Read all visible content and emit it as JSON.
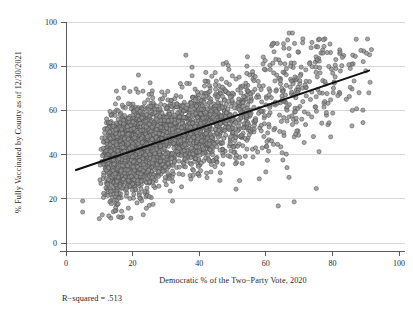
{
  "figure": {
    "background_color": "#ffffff",
    "width": 413,
    "height": 316
  },
  "chart_data": {
    "type": "scatter",
    "title": "",
    "xlabel": "Democratic % of the Two−Party Vote, 2020",
    "ylabel": "% Fully Vaccinated by County as of 12/30/2021",
    "xlim": [
      0,
      100
    ],
    "ylim": [
      0,
      100
    ],
    "xticks": [
      0,
      20,
      40,
      60,
      80,
      100
    ],
    "yticks": [
      0,
      20,
      40,
      60,
      80,
      100
    ],
    "xtick_labels": [
      "0",
      "20",
      "40",
      "60",
      "80",
      "100"
    ],
    "ytick_labels": [
      "0",
      "20",
      "40",
      "60",
      "80",
      "100"
    ],
    "grid": "horizontal",
    "legend": "none",
    "marker": {
      "shape": "circle",
      "fill_color": "#8f8f8f",
      "edge_color": "#4f4f4f",
      "radius_px": 2.1,
      "opacity": 0.78
    },
    "point_count": 3110,
    "x_range_observed": [
      3,
      92
    ],
    "y_range_observed": [
      11,
      95
    ],
    "annotations": [
      {
        "name": "r-squared-note",
        "text": "R−squared = .513",
        "x_px": 62,
        "y_px": 298
      }
    ],
    "fit_line": {
      "name": "linear-regression-line",
      "color": "#111111",
      "width_px": 2.1,
      "x_start": 3,
      "y_start": 33,
      "x_end": 91,
      "y_end": 78,
      "slope": 0.511,
      "intercept": 31.47,
      "r_squared": 0.513
    },
    "series": [
      {
        "name": "counties",
        "description": "US counties: Democratic two-party vote share 2020 vs % fully vaccinated as of 12/30/2021",
        "correlation": 0.716
      }
    ],
    "density_profile": {
      "note": "Dense overlapping cloud concentrated between 10-60% Democratic vote and 30-65% vaccinated, with a thinning right tail and scattered high/low outliers.",
      "core_x": [
        10,
        60
      ],
      "core_y": [
        30,
        65
      ],
      "residual_sd": 9.6
    },
    "outliers": [
      {
        "x": 67,
        "y": 95
      },
      {
        "x": 68,
        "y": 95
      },
      {
        "x": 62,
        "y": 90
      },
      {
        "x": 67,
        "y": 88
      },
      {
        "x": 36,
        "y": 85
      },
      {
        "x": 83,
        "y": 84
      },
      {
        "x": 81,
        "y": 83
      },
      {
        "x": 10,
        "y": 11
      },
      {
        "x": 5,
        "y": 14
      },
      {
        "x": 5,
        "y": 19
      },
      {
        "x": 32,
        "y": 19
      },
      {
        "x": 25,
        "y": 21
      },
      {
        "x": 88,
        "y": 68
      },
      {
        "x": 86,
        "y": 60
      }
    ]
  },
  "layout": {
    "plot_left_px": 66,
    "plot_right_px": 399,
    "plot_top_px": 22,
    "plot_bottom_px": 243,
    "x_unit_px": 3.33,
    "y_unit_px": 2.21
  }
}
